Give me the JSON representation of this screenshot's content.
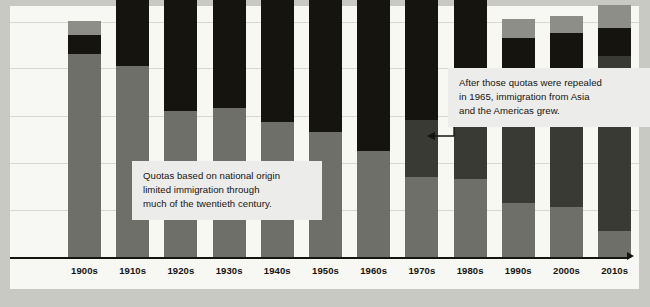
{
  "chart_data": {
    "type": "bar",
    "subtype": "stacked-bar",
    "title": "",
    "xlabel": "",
    "ylabel": "",
    "grid": true,
    "gridlines": 5,
    "legend": "none",
    "axis_arrow": true,
    "categories": [
      "1900s",
      "1910s",
      "1920s",
      "1930s",
      "1940s",
      "1950s",
      "1960s",
      "1970s",
      "1980s",
      "1990s",
      "2000s",
      "2010s"
    ],
    "series": [
      {
        "name": "Americas",
        "color": "#6f6f69",
        "values": [
          86,
          81,
          62,
          63,
          57,
          53,
          45,
          34,
          33,
          23,
          21,
          11
        ]
      },
      {
        "name": "Asia",
        "color": "#3a3a35",
        "values": [
          0,
          0,
          0,
          0,
          0,
          0,
          0,
          24,
          37,
          43,
          52,
          74
        ]
      },
      {
        "name": "Europe",
        "color": "#15140f",
        "values": [
          8,
          38,
          74,
          66,
          71,
          88,
          83,
          59,
          49,
          27,
          22,
          12
        ]
      },
      {
        "name": "Other",
        "color": "#8e8e88",
        "values": [
          6,
          2,
          0,
          0,
          7,
          3,
          3,
          4,
          6,
          8,
          7,
          10
        ]
      }
    ],
    "annotations": [
      {
        "name": "quotas-note",
        "lines": [
          "Quotas based on national origin",
          "limited immigration through",
          "much of the twentieth century."
        ]
      },
      {
        "name": "repealed-note",
        "lines": [
          "After those quotas were repealed",
          "in 1965, immigration from Asia",
          "and the Americas grew."
        ]
      }
    ],
    "colors": {
      "background": "#c9c9c4",
      "panel": "#f7f7f4",
      "gridline": "#d8d8d2",
      "axis": "#15140f",
      "callout_bg": "#ececeb",
      "text": "#15140f"
    }
  }
}
